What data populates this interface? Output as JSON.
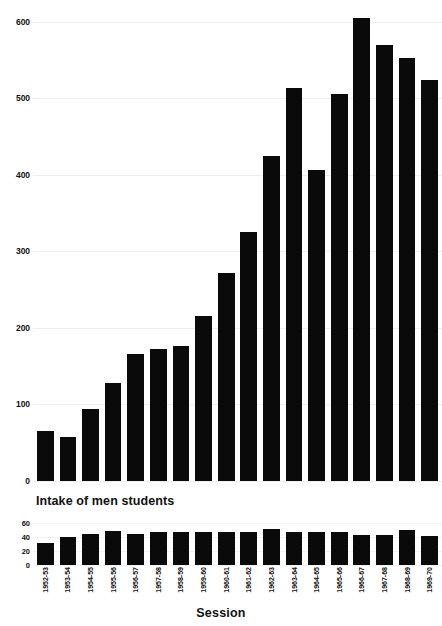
{
  "chart_data": [
    {
      "id": "main",
      "type": "bar",
      "title": "",
      "xlabel": "Session",
      "ylabel": "",
      "ylim": [
        0,
        610
      ],
      "yticks": [
        0,
        100,
        200,
        300,
        400,
        500,
        600
      ],
      "ytick_labels": [
        "0",
        "100",
        "200",
        "300",
        "400",
        "500",
        "600"
      ],
      "grid": true,
      "legend": "none",
      "bar_color": "#0a0a0a",
      "categories": [
        "1952-53",
        "1953-54",
        "1954-55",
        "1955-56",
        "1956-57",
        "1957-58",
        "1958-59",
        "1959-60",
        "1960-61",
        "1961-62",
        "1962-63",
        "1963-64",
        "1964-65",
        "1965-66",
        "1966-67",
        "1967-68",
        "1968-69",
        "1969-70"
      ],
      "values": [
        65,
        57,
        94,
        128,
        166,
        172,
        177,
        216,
        272,
        325,
        425,
        514,
        406,
        506,
        605,
        569,
        553,
        524
      ]
    },
    {
      "id": "sub",
      "type": "bar",
      "title": "Intake of men students",
      "xlabel": "Session",
      "ylabel": "",
      "ylim": [
        0,
        66
      ],
      "yticks": [
        0,
        20,
        40,
        60
      ],
      "ytick_labels": [
        "0",
        "20",
        "40",
        "60"
      ],
      "grid": true,
      "legend": "none",
      "bar_color": "#0a0a0a",
      "categories": [
        "1952-53",
        "1953-54",
        "1954-55",
        "1955-56",
        "1956-57",
        "1957-58",
        "1958-59",
        "1959-60",
        "1960-61",
        "1961-62",
        "1962-63",
        "1963-64",
        "1964-65",
        "1965-66",
        "1966-67",
        "1967-68",
        "1968-69",
        "1969-70"
      ],
      "values": [
        32,
        40,
        44,
        49,
        45,
        47,
        48,
        48,
        48,
        48,
        52,
        47,
        47,
        47,
        43,
        43,
        50,
        42
      ]
    }
  ],
  "figure": {
    "background": "#ffffff",
    "axis_title": "Session",
    "sub_title": "Intake of men students"
  }
}
